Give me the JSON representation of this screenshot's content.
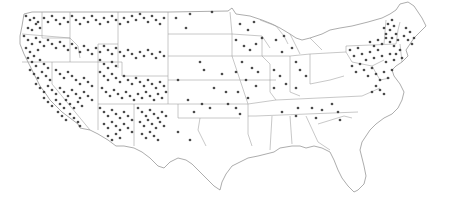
{
  "map": {
    "title": "United States point distribution map",
    "background_color": "#ffffff",
    "border_color": "#8a8a8a",
    "state_line_color": "#9a9a9a",
    "dot_color": "#2b2b2b",
    "dot_radius": 1.35,
    "outline_path": "M24 14 L32 12 L78 12 L118 12 L170 12 L228 11 L232 8 L236 14 L250 16 L262 20 L272 24 L280 28 L290 34 L296 38 L302 40 L310 38 L322 34 L330 30 L340 28 L352 26 L368 22 L382 18 L390 14 L396 10 L400 4 L408 2 L414 6 L418 12 L422 18 L426 26 L420 32 L414 38 L410 44 L406 50 L408 56 L402 62 L396 66 L392 70 L394 76 L400 84 L404 92 L402 100 L398 108 L392 114 L384 118 L376 124 L370 130 L366 136 L362 142 L360 150 L362 158 L364 166 L366 176 L364 184 L358 190 L354 192 L348 186 L342 178 L338 170 L334 160 L330 152 L322 148 L314 146 L306 148 L300 146 L292 146 L280 148 L274 152 L266 154 L258 156 L248 158 L240 162 L232 166 L226 174 L222 182 L220 190 L214 186 L206 178 L198 170 L192 164 L186 160 L178 158 L170 162 L164 168 L158 166 L150 158 L142 152 L134 148 L124 146 L116 146 L108 140 L98 134 L90 130 L80 128 L78 124 L70 118 L62 112 L56 106 L50 100 L46 94 L40 86 L36 78 L32 70 L28 62 L24 54 L20 44 L20 36 L22 26 Z",
    "state_lines": [
      "M42 12 L42 38 L70 38 L70 12",
      "M22 34 L70 38",
      "M70 38 L70 62",
      "M22 62 L70 62",
      "M52 62 L52 84 L90 130",
      "M70 62 L98 62 L98 104",
      "M98 62 L98 44 L118 44 L118 68",
      "M98 62 L122 62 L122 76 L168 76",
      "M118 12 L118 44",
      "M70 38 L78 46 L80 58",
      "M98 104 L98 130",
      "M98 104 L134 104 L134 146",
      "M134 104 L168 104",
      "M168 12 L168 104",
      "M168 34 L232 34",
      "M168 56 L232 56",
      "M168 80 L240 80",
      "M168 104 L248 104",
      "M178 104 L178 118 L240 118",
      "M230 12 L232 34 L232 56 L240 80 L248 104",
      "M248 104 L248 134 L252 146",
      "M232 34 L262 36 L270 48",
      "M232 56 L270 56",
      "M240 80 L276 80",
      "M262 36 L262 56 L270 64 L270 92 L276 100",
      "M276 100 L248 104",
      "M270 56 L290 56",
      "M290 56 L290 92 L300 96",
      "M290 56 L310 54 L310 84",
      "M310 54 L346 52",
      "M310 84 L330 80 L344 76",
      "M276 100 L362 96",
      "M256 116 L358 112",
      "M272 116 L270 150",
      "M290 116 L292 144",
      "M306 116 L318 142",
      "M318 142 L330 150",
      "M318 124 L344 116 L352 118",
      "M346 52 L346 46 L396 44",
      "M346 52 L352 62 L372 66 L384 60",
      "M372 66 L380 80 L390 78",
      "M362 96 L380 88",
      "M384 44 L386 20",
      "M396 44 L398 30 L400 22",
      "M402 62 L400 44",
      "M260 20 L276 26 L284 36 L288 44",
      "M290 34 L296 46 L300 54",
      "M310 38 L316 44 L322 50",
      "M248 116 L256 116",
      "M200 118 L198 130 L206 146"
    ],
    "dots": [
      [
        26,
        16
      ],
      [
        30,
        20
      ],
      [
        34,
        18
      ],
      [
        36,
        24
      ],
      [
        28,
        28
      ],
      [
        32,
        30
      ],
      [
        38,
        22
      ],
      [
        40,
        28
      ],
      [
        44,
        18
      ],
      [
        48,
        22
      ],
      [
        52,
        16
      ],
      [
        56,
        20
      ],
      [
        60,
        24
      ],
      [
        64,
        18
      ],
      [
        68,
        22
      ],
      [
        72,
        16
      ],
      [
        76,
        20
      ],
      [
        80,
        24
      ],
      [
        84,
        18
      ],
      [
        88,
        22
      ],
      [
        92,
        16
      ],
      [
        96,
        20
      ],
      [
        100,
        24
      ],
      [
        104,
        18
      ],
      [
        108,
        22
      ],
      [
        112,
        16
      ],
      [
        116,
        20
      ],
      [
        120,
        24
      ],
      [
        124,
        18
      ],
      [
        128,
        22
      ],
      [
        132,
        16
      ],
      [
        136,
        20
      ],
      [
        140,
        14
      ],
      [
        144,
        18
      ],
      [
        148,
        22
      ],
      [
        152,
        16
      ],
      [
        156,
        20
      ],
      [
        160,
        24
      ],
      [
        164,
        18
      ],
      [
        24,
        36
      ],
      [
        28,
        40
      ],
      [
        32,
        44
      ],
      [
        36,
        38
      ],
      [
        40,
        42
      ],
      [
        44,
        46
      ],
      [
        48,
        40
      ],
      [
        52,
        44
      ],
      [
        56,
        48
      ],
      [
        60,
        42
      ],
      [
        64,
        46
      ],
      [
        68,
        50
      ],
      [
        72,
        44
      ],
      [
        76,
        48
      ],
      [
        80,
        52
      ],
      [
        84,
        46
      ],
      [
        88,
        50
      ],
      [
        92,
        54
      ],
      [
        96,
        48
      ],
      [
        100,
        52
      ],
      [
        104,
        46
      ],
      [
        108,
        50
      ],
      [
        112,
        54
      ],
      [
        116,
        48
      ],
      [
        120,
        52
      ],
      [
        124,
        56
      ],
      [
        128,
        50
      ],
      [
        132,
        54
      ],
      [
        136,
        58
      ],
      [
        140,
        52
      ],
      [
        144,
        56
      ],
      [
        148,
        50
      ],
      [
        152,
        54
      ],
      [
        156,
        58
      ],
      [
        160,
        52
      ],
      [
        164,
        56
      ],
      [
        26,
        48
      ],
      [
        30,
        52
      ],
      [
        34,
        56
      ],
      [
        38,
        50
      ],
      [
        28,
        58
      ],
      [
        32,
        62
      ],
      [
        36,
        66
      ],
      [
        40,
        60
      ],
      [
        44,
        64
      ],
      [
        48,
        68
      ],
      [
        30,
        70
      ],
      [
        34,
        74
      ],
      [
        38,
        78
      ],
      [
        42,
        72
      ],
      [
        46,
        76
      ],
      [
        50,
        80
      ],
      [
        36,
        84
      ],
      [
        40,
        88
      ],
      [
        44,
        92
      ],
      [
        48,
        86
      ],
      [
        52,
        90
      ],
      [
        56,
        94
      ],
      [
        44,
        98
      ],
      [
        48,
        102
      ],
      [
        52,
        106
      ],
      [
        56,
        100
      ],
      [
        60,
        104
      ],
      [
        64,
        108
      ],
      [
        58,
        112
      ],
      [
        62,
        116
      ],
      [
        66,
        120
      ],
      [
        70,
        114
      ],
      [
        74,
        118
      ],
      [
        78,
        122
      ],
      [
        80,
        126
      ],
      [
        56,
        70
      ],
      [
        60,
        74
      ],
      [
        64,
        78
      ],
      [
        68,
        72
      ],
      [
        72,
        76
      ],
      [
        76,
        80
      ],
      [
        80,
        84
      ],
      [
        84,
        78
      ],
      [
        88,
        82
      ],
      [
        92,
        86
      ],
      [
        60,
        88
      ],
      [
        64,
        92
      ],
      [
        68,
        96
      ],
      [
        72,
        90
      ],
      [
        76,
        94
      ],
      [
        80,
        98
      ],
      [
        84,
        92
      ],
      [
        88,
        96
      ],
      [
        92,
        100
      ],
      [
        66,
        100
      ],
      [
        70,
        104
      ],
      [
        74,
        108
      ],
      [
        78,
        102
      ],
      [
        82,
        106
      ],
      [
        100,
        60
      ],
      [
        104,
        64
      ],
      [
        108,
        68
      ],
      [
        112,
        62
      ],
      [
        116,
        66
      ],
      [
        100,
        72
      ],
      [
        104,
        76
      ],
      [
        108,
        80
      ],
      [
        112,
        74
      ],
      [
        116,
        78
      ],
      [
        120,
        82
      ],
      [
        124,
        76
      ],
      [
        128,
        80
      ],
      [
        132,
        84
      ],
      [
        136,
        78
      ],
      [
        140,
        82
      ],
      [
        144,
        86
      ],
      [
        148,
        80
      ],
      [
        152,
        84
      ],
      [
        156,
        88
      ],
      [
        160,
        82
      ],
      [
        164,
        86
      ],
      [
        102,
        88
      ],
      [
        106,
        92
      ],
      [
        110,
        96
      ],
      [
        114,
        90
      ],
      [
        118,
        94
      ],
      [
        122,
        98
      ],
      [
        126,
        92
      ],
      [
        130,
        96
      ],
      [
        134,
        100
      ],
      [
        138,
        94
      ],
      [
        142,
        98
      ],
      [
        146,
        92
      ],
      [
        150,
        96
      ],
      [
        154,
        100
      ],
      [
        158,
        94
      ],
      [
        162,
        98
      ],
      [
        166,
        92
      ],
      [
        100,
        108
      ],
      [
        104,
        112
      ],
      [
        108,
        116
      ],
      [
        112,
        110
      ],
      [
        116,
        114
      ],
      [
        120,
        118
      ],
      [
        124,
        112
      ],
      [
        128,
        116
      ],
      [
        132,
        120
      ],
      [
        104,
        124
      ],
      [
        108,
        128
      ],
      [
        112,
        122
      ],
      [
        116,
        126
      ],
      [
        120,
        130
      ],
      [
        124,
        124
      ],
      [
        128,
        128
      ],
      [
        132,
        132
      ],
      [
        108,
        136
      ],
      [
        112,
        140
      ],
      [
        116,
        134
      ],
      [
        120,
        138
      ],
      [
        138,
        108
      ],
      [
        142,
        112
      ],
      [
        146,
        116
      ],
      [
        150,
        110
      ],
      [
        154,
        114
      ],
      [
        158,
        118
      ],
      [
        162,
        112
      ],
      [
        166,
        116
      ],
      [
        140,
        122
      ],
      [
        144,
        126
      ],
      [
        148,
        120
      ],
      [
        152,
        124
      ],
      [
        156,
        128
      ],
      [
        160,
        122
      ],
      [
        164,
        126
      ],
      [
        142,
        134
      ],
      [
        146,
        138
      ],
      [
        150,
        132
      ],
      [
        154,
        136
      ],
      [
        158,
        140
      ],
      [
        176,
        18
      ],
      [
        190,
        14
      ],
      [
        212,
        12
      ],
      [
        186,
        28
      ],
      [
        200,
        62
      ],
      [
        178,
        80
      ],
      [
        188,
        100
      ],
      [
        204,
        70
      ],
      [
        214,
        88
      ],
      [
        222,
        74
      ],
      [
        226,
        92
      ],
      [
        194,
        112
      ],
      [
        178,
        132
      ],
      [
        190,
        140
      ],
      [
        202,
        104
      ],
      [
        210,
        108
      ],
      [
        240,
        24
      ],
      [
        248,
        30
      ],
      [
        254,
        22
      ],
      [
        236,
        40
      ],
      [
        244,
        46
      ],
      [
        250,
        50
      ],
      [
        256,
        44
      ],
      [
        262,
        38
      ],
      [
        242,
        62
      ],
      [
        252,
        68
      ],
      [
        258,
        72
      ],
      [
        236,
        72
      ],
      [
        246,
        80
      ],
      [
        256,
        86
      ],
      [
        238,
        92
      ],
      [
        248,
        98
      ],
      [
        228,
        104
      ],
      [
        236,
        108
      ],
      [
        240,
        114
      ],
      [
        276,
        40
      ],
      [
        284,
        36
      ],
      [
        282,
        52
      ],
      [
        292,
        48
      ],
      [
        274,
        70
      ],
      [
        280,
        76
      ],
      [
        286,
        84
      ],
      [
        274,
        88
      ],
      [
        296,
        62
      ],
      [
        300,
        70
      ],
      [
        306,
        76
      ],
      [
        296,
        88
      ],
      [
        282,
        112
      ],
      [
        298,
        108
      ],
      [
        312,
        108
      ],
      [
        322,
        110
      ],
      [
        332,
        104
      ],
      [
        338,
        112
      ],
      [
        340,
        120
      ],
      [
        316,
        118
      ],
      [
        296,
        116
      ],
      [
        350,
        50
      ],
      [
        354,
        56
      ],
      [
        358,
        48
      ],
      [
        362,
        54
      ],
      [
        366,
        60
      ],
      [
        370,
        52
      ],
      [
        374,
        58
      ],
      [
        378,
        50
      ],
      [
        382,
        56
      ],
      [
        386,
        62
      ],
      [
        390,
        54
      ],
      [
        394,
        60
      ],
      [
        352,
        66
      ],
      [
        356,
        72
      ],
      [
        360,
        64
      ],
      [
        364,
        70
      ],
      [
        368,
        76
      ],
      [
        372,
        68
      ],
      [
        376,
        74
      ],
      [
        380,
        80
      ],
      [
        384,
        72
      ],
      [
        388,
        78
      ],
      [
        392,
        70
      ],
      [
        370,
        42
      ],
      [
        374,
        46
      ],
      [
        378,
        40
      ],
      [
        382,
        44
      ],
      [
        386,
        38
      ],
      [
        390,
        42
      ],
      [
        394,
        46
      ],
      [
        398,
        40
      ],
      [
        384,
        28
      ],
      [
        388,
        24
      ],
      [
        392,
        20
      ],
      [
        386,
        34
      ],
      [
        390,
        30
      ],
      [
        394,
        26
      ],
      [
        396,
        34
      ],
      [
        392,
        38
      ],
      [
        400,
        50
      ],
      [
        396,
        54
      ],
      [
        402,
        58
      ],
      [
        404,
        36
      ],
      [
        408,
        40
      ],
      [
        412,
        44
      ],
      [
        406,
        28
      ],
      [
        410,
        32
      ],
      [
        414,
        38
      ],
      [
        376,
        86
      ],
      [
        380,
        90
      ],
      [
        384,
        94
      ],
      [
        372,
        92
      ]
    ]
  }
}
